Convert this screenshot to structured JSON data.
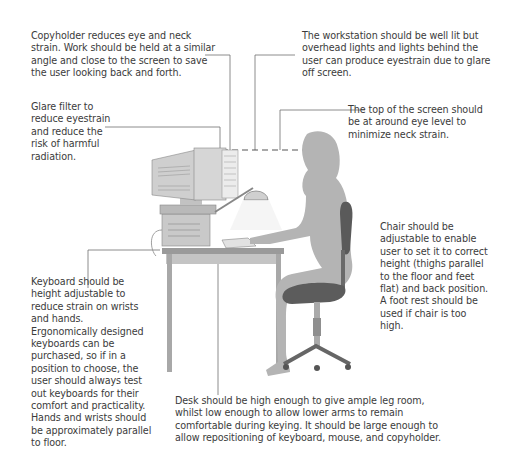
{
  "diagram": {
    "annotations": {
      "copyholder": "Copyholder reduces eye and neck\nstrain. Work should be held at a similar\nangle and close to the screen to save\nthe user looking back and forth.",
      "lighting": "The workstation should be well lit but\noverhead lights and lights behind the\nuser can produce eyestrain due to glare\noff screen.",
      "glare_filter": "Glare filter to\nreduce eyestrain\nand reduce the\nrisk of harmful\nradiation.",
      "screen_height": "The top of the screen should\nbe at around eye level to\nminimize neck strain.",
      "chair": "Chair should be\nadjustable to enable\nuser to set it to correct\nheight (thighs parallel\nto the floor and feet\nflat) and back position.\nA foot rest should be\nused if chair is too\nhigh.",
      "keyboard": "Keyboard should be\nheight adjustable to\nreduce strain on wrists\nand hands.\nErgonomically designed\nkeyboards can be\npurchased, so if in a\nposition to choose, the\nuser should always test\nout keyboards for their\ncomfort and practicality.\nHands and wrists should\nbe approximately parallel\nto floor.",
      "desk": "Desk should be high enough to give ample leg room,\nwhilst low enough to allow lower arms to remain\ncomfortable during keying. It should be large enough to\nallow repositioning of  keyboard, mouse, and copyholder."
    },
    "colors": {
      "leader_line": "#6e6e6e",
      "silhouette": "#b4b4b4",
      "chair": "#5a5a5a",
      "desk": "#a8a8a8",
      "text": "#3b3b3b"
    }
  }
}
